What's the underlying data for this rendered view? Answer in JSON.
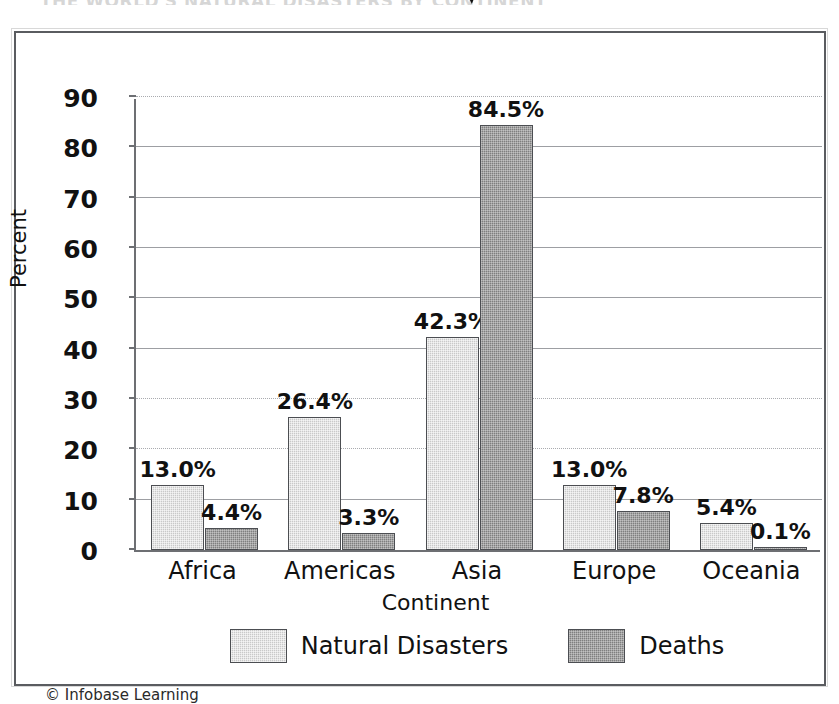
{
  "page": {
    "title_remnant": "THE WORLD'S NATURAL DISASTERS BY CONTINENT",
    "copyright": "© Infobase Learning"
  },
  "chart_data": {
    "type": "bar",
    "title": "",
    "xlabel": "Continent",
    "ylabel": "Percent",
    "ylim": [
      0,
      90
    ],
    "yticks": [
      0,
      10,
      20,
      30,
      40,
      50,
      60,
      70,
      80,
      90
    ],
    "ytick_labels": [
      "0",
      "10",
      "20",
      "30",
      "40",
      "50",
      "60",
      "70",
      "80",
      "90"
    ],
    "grid": true,
    "legend_position": "bottom",
    "categories": [
      "Africa",
      "Americas",
      "Asia",
      "Europe",
      "Oceania"
    ],
    "series": [
      {
        "name": "Natural Disasters",
        "color": "#c9c9c9",
        "values": [
          13.0,
          26.4,
          42.3,
          13.0,
          5.4
        ],
        "labels": [
          "13.0%",
          "26.4%",
          "42.3%",
          "13.0%",
          "5.4%"
        ]
      },
      {
        "name": "Deaths",
        "color": "#7f7f7f",
        "values": [
          4.4,
          3.3,
          84.5,
          7.8,
          0.1
        ],
        "labels": [
          "4.4%",
          "3.3%",
          "84.5%",
          "7.8%",
          "0.1%"
        ]
      }
    ]
  }
}
